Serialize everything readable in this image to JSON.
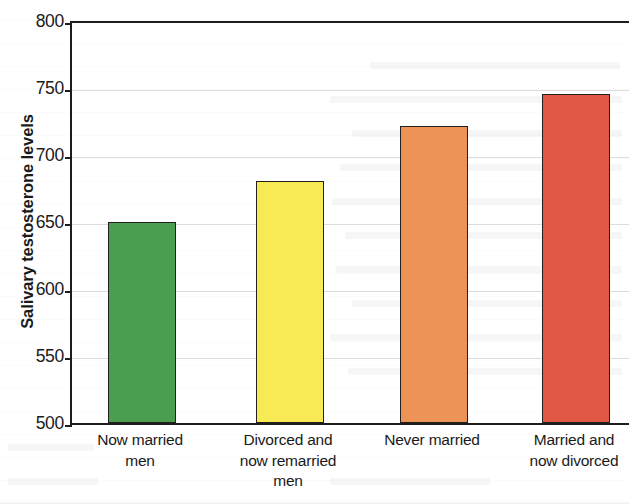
{
  "chart_data": {
    "type": "bar",
    "title": "",
    "xlabel": "",
    "ylabel": "Salivary testosterone levels",
    "categories": [
      "Now married\nmen",
      "Divorced and\nnow remarried\nmen",
      "Never married",
      "Married and\nnow divorced"
    ],
    "category_lines": [
      [
        "Now married",
        "men"
      ],
      [
        "Divorced and",
        "now remarried",
        "men"
      ],
      [
        "Never married"
      ],
      [
        "Married and",
        "now divorced"
      ]
    ],
    "values": [
      650,
      681,
      722,
      746
    ],
    "ylim": [
      500,
      800
    ],
    "yticks": [
      500,
      550,
      600,
      650,
      700,
      750,
      800
    ],
    "ytick_labels": [
      "500",
      "550",
      "600",
      "650",
      "700",
      "750",
      "800"
    ],
    "grid": true,
    "legend": "none",
    "bar_colors": [
      "#4a9e4f",
      "#f8ea55",
      "#ed9357",
      "#e05845"
    ],
    "bar_edge_color": "#231f1c",
    "axis_color": "#1d1d1d",
    "gridline_color": "#787878",
    "background_color": "#ffffff"
  }
}
